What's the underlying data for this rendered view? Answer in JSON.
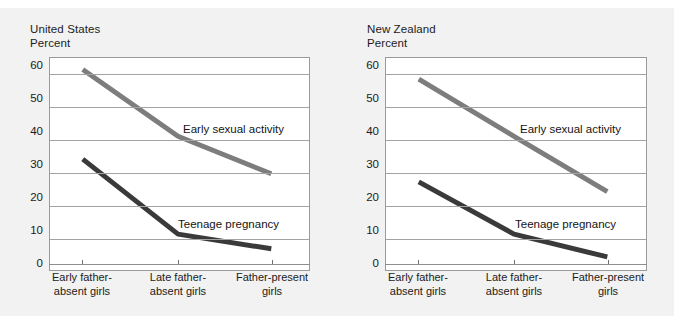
{
  "figure": {
    "background_color": "#f2f2f2",
    "plot_background_color": "#ffffff",
    "gridline_color": "#a3a3a3",
    "series_colors": {
      "early_sexual_activity": "#7d7d7d",
      "teenage_pregnancy": "#3a3a3a"
    }
  },
  "panels": [
    {
      "id": "united-states",
      "title": "United States",
      "axis_unit": "Percent"
    },
    {
      "id": "new-zealand",
      "title": "New Zealand",
      "axis_unit": "Percent"
    }
  ],
  "annotations": {
    "early_sexual_activity": "Early sexual activity",
    "teenage_pregnancy": "Teenage pregnancy"
  },
  "chart_data": [
    {
      "type": "line",
      "title": "United States",
      "xlabel": "",
      "ylabel": "Percent",
      "ylim": [
        0,
        65
      ],
      "yticks": [
        0,
        10,
        20,
        30,
        40,
        50,
        60
      ],
      "ytick_labels": [
        "0",
        "10",
        "20",
        "30",
        "40",
        "50",
        "60"
      ],
      "grid": true,
      "legend": "inline-annotation",
      "categories": [
        "Early father-\nabsent girls",
        "Late father-\nabsent girls",
        "Father-present\ngirls"
      ],
      "category_lines": [
        [
          "Early father-",
          "absent girls"
        ],
        [
          "Late father-",
          "absent girls"
        ],
        [
          "Father-present",
          "girls"
        ]
      ],
      "series": [
        {
          "name": "Early sexual activity",
          "color": "#7d7d7d",
          "values": [
            61.5,
            41,
            29.5
          ]
        },
        {
          "name": "Teenage pregnancy",
          "color": "#3a3a3a",
          "values": [
            34,
            11,
            6.5
          ]
        }
      ]
    },
    {
      "type": "line",
      "title": "New Zealand",
      "xlabel": "",
      "ylabel": "Percent",
      "ylim": [
        0,
        65
      ],
      "yticks": [
        0,
        10,
        20,
        30,
        40,
        50,
        60
      ],
      "ytick_labels": [
        "0",
        "10",
        "20",
        "30",
        "40",
        "50",
        "60"
      ],
      "grid": true,
      "legend": "inline-annotation",
      "categories": [
        "Early father-\nabsent girls",
        "Late father-\nabsent girls",
        "Father-present\ngirls"
      ],
      "category_lines": [
        [
          "Early father-",
          "absent girls"
        ],
        [
          "Late father-",
          "absent girls"
        ],
        [
          "Father-present",
          "girls"
        ]
      ],
      "series": [
        {
          "name": "Early sexual activity",
          "color": "#7d7d7d",
          "values": [
            58.5,
            41,
            24
          ]
        },
        {
          "name": "Teenage pregnancy",
          "color": "#3a3a3a",
          "values": [
            27,
            11,
            4
          ]
        }
      ]
    }
  ]
}
